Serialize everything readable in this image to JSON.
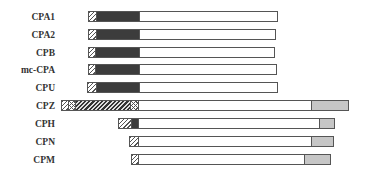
{
  "diagram": {
    "type": "domain-architecture",
    "legend_colors": {
      "outline": "#555555",
      "dark": "#3c3c3c",
      "gray": "#c6c6c6",
      "white": "#ffffff"
    },
    "rows": [
      {
        "label": "CPA1",
        "y": 11,
        "segments": [
          {
            "kind": "hatch",
            "x0": 88,
            "x1": 96
          },
          {
            "kind": "dark",
            "x0": 96,
            "x1": 139
          },
          {
            "kind": "white",
            "x0": 139,
            "x1": 277
          }
        ]
      },
      {
        "label": "CPA2",
        "y": 29,
        "segments": [
          {
            "kind": "hatch",
            "x0": 88,
            "x1": 96
          },
          {
            "kind": "dark",
            "x0": 96,
            "x1": 139
          },
          {
            "kind": "white",
            "x0": 139,
            "x1": 275
          }
        ]
      },
      {
        "label": "CPB",
        "y": 47,
        "segments": [
          {
            "kind": "hatch",
            "x0": 88,
            "x1": 95
          },
          {
            "kind": "dark",
            "x0": 95,
            "x1": 139
          },
          {
            "kind": "white",
            "x0": 139,
            "x1": 274
          }
        ]
      },
      {
        "label": "mc-CPA",
        "y": 64,
        "segments": [
          {
            "kind": "hatch",
            "x0": 88,
            "x1": 95
          },
          {
            "kind": "dark",
            "x0": 95,
            "x1": 139
          },
          {
            "kind": "white",
            "x0": 139,
            "x1": 276
          }
        ]
      },
      {
        "label": "CPU",
        "y": 82,
        "segments": [
          {
            "kind": "hatch",
            "x0": 87,
            "x1": 96
          },
          {
            "kind": "dark",
            "x0": 96,
            "x1": 139
          },
          {
            "kind": "white",
            "x0": 139,
            "x1": 277
          }
        ]
      },
      {
        "label": "CPZ",
        "y": 100,
        "segments": [
          {
            "kind": "hatch",
            "x0": 61,
            "x1": 68
          },
          {
            "kind": "cross",
            "x0": 68,
            "x1": 75
          },
          {
            "kind": "hatch-dense",
            "x0": 75,
            "x1": 130
          },
          {
            "kind": "cross",
            "x0": 130,
            "x1": 138
          },
          {
            "kind": "white",
            "x0": 138,
            "x1": 311
          },
          {
            "kind": "gray",
            "x0": 311,
            "x1": 348
          }
        ]
      },
      {
        "label": "CPH",
        "y": 118,
        "segments": [
          {
            "kind": "hatch",
            "x0": 118,
            "x1": 131
          },
          {
            "kind": "dark",
            "x0": 131,
            "x1": 138
          },
          {
            "kind": "white",
            "x0": 138,
            "x1": 319
          },
          {
            "kind": "gray",
            "x0": 319,
            "x1": 334
          }
        ]
      },
      {
        "label": "CPN",
        "y": 136,
        "segments": [
          {
            "kind": "hatch",
            "x0": 129,
            "x1": 138
          },
          {
            "kind": "white",
            "x0": 138,
            "x1": 311
          },
          {
            "kind": "gray",
            "x0": 311,
            "x1": 333
          }
        ]
      },
      {
        "label": "CPM",
        "y": 154,
        "segments": [
          {
            "kind": "hatch",
            "x0": 131,
            "x1": 138
          },
          {
            "kind": "white",
            "x0": 138,
            "x1": 304
          },
          {
            "kind": "gray",
            "x0": 304,
            "x1": 330
          }
        ]
      }
    ]
  }
}
